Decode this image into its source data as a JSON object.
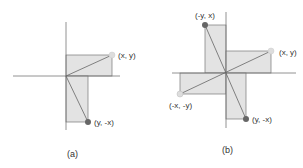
{
  "colors": {
    "fill": "#e3e3e3",
    "stroke": "#666666",
    "axis": "#777777",
    "point_light": "#dddddd",
    "point_dark": "#666666"
  },
  "figure_a": {
    "caption": "(a)",
    "points": [
      {
        "label": "(x, y)",
        "shade": "light"
      },
      {
        "label": "(y, -x)",
        "shade": "dark"
      }
    ]
  },
  "figure_b": {
    "caption": "(b)",
    "points": [
      {
        "label": "(x, y)",
        "shade": "light"
      },
      {
        "label": "(-y, x)",
        "shade": "dark"
      },
      {
        "label": "(-x, -y)",
        "shade": "light"
      },
      {
        "label": "(y, -x)",
        "shade": "dark"
      }
    ]
  }
}
